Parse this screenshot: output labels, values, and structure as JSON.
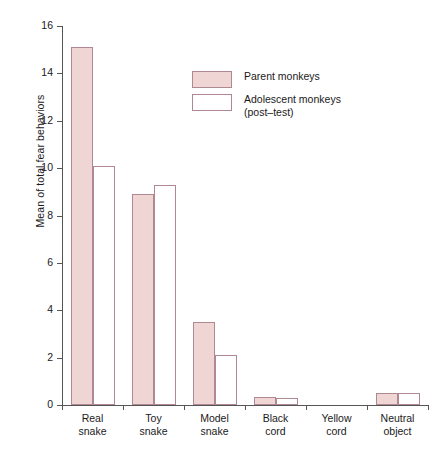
{
  "chart_data": {
    "type": "bar",
    "title": "",
    "xlabel": "",
    "ylabel": "Mean of total fear behaviors",
    "ylim": [
      0,
      16
    ],
    "yticks": [
      0,
      2,
      4,
      6,
      8,
      10,
      12,
      14,
      16
    ],
    "ytick_labels": [
      "0",
      "2",
      "4",
      "6",
      "8",
      "10",
      "12",
      "14",
      "16"
    ],
    "grid": false,
    "legend_position": "upper-center-right",
    "categories": [
      "Real snake",
      "Toy snake",
      "Model snake",
      "Black cord",
      "Yellow cord",
      "Neutral object"
    ],
    "category_lines": [
      [
        "Real",
        "snake"
      ],
      [
        "Toy",
        "snake"
      ],
      [
        "Model",
        "snake"
      ],
      [
        "Black",
        "cord"
      ],
      [
        "Yellow",
        "cord"
      ],
      [
        "Neutral",
        "object"
      ]
    ],
    "series": [
      {
        "name": "Parent monkeys",
        "style": "filled",
        "fill": "#f0d5d5",
        "stroke": "#b08891",
        "values": [
          15.1,
          8.9,
          3.5,
          0.35,
          0,
          0.5
        ]
      },
      {
        "name": "Adolescent monkeys (post-test)",
        "name_line1": "Adolescent monkeys",
        "name_line2": "(post–test)",
        "style": "open",
        "fill": "#ffffff",
        "stroke": "#b08891",
        "values": [
          10.1,
          9.3,
          2.1,
          0.3,
          0,
          0.5
        ]
      }
    ]
  },
  "legend": {
    "items": [
      {
        "label": "Parent monkeys",
        "sub": "",
        "style": "filled"
      },
      {
        "label": "Adolescent monkeys",
        "sub": "(post–test)",
        "style": "open"
      }
    ]
  },
  "colors": {
    "bar_fill": "#f0d5d5",
    "bar_stroke": "#b08891",
    "axis": "#555555",
    "text": "#1a1a1a",
    "background": "#ffffff"
  }
}
